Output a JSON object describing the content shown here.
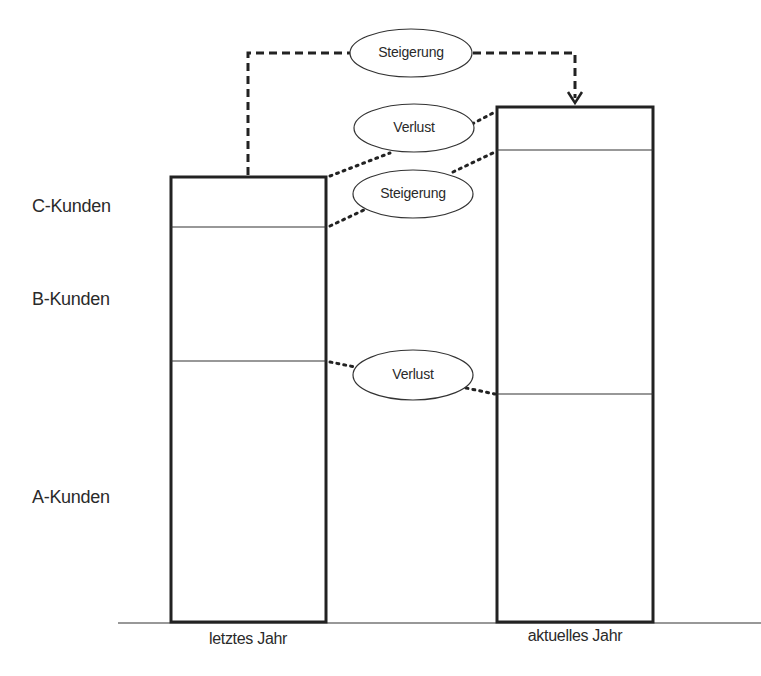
{
  "diagram": {
    "row_labels": [
      "C-Kunden",
      "B-Kunden",
      "A-Kunden"
    ],
    "bars": [
      {
        "label": "letztes Jahr",
        "segments": [
          "C-Kunden",
          "B-Kunden",
          "A-Kunden"
        ]
      },
      {
        "label": "aktuelles Jahr",
        "segments": [
          "C-Kunden",
          "B-Kunden",
          "A-Kunden"
        ]
      }
    ],
    "annotations": {
      "total_change": "Steigerung",
      "c_change": "Verlust",
      "b_change": "Steigerung",
      "a_change": "Verlust"
    },
    "colors": {
      "line": "#222222",
      "background": "#ffffff"
    }
  }
}
